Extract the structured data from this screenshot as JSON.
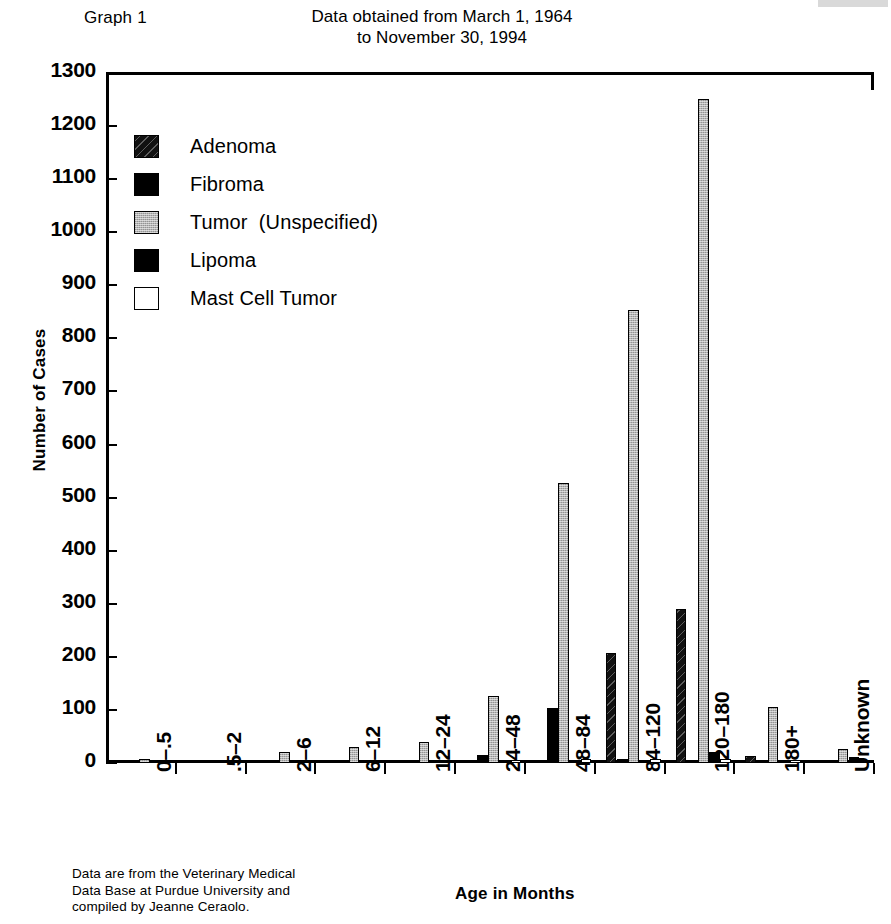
{
  "header": {
    "graph_number": "Graph 1",
    "subtitle_line1": "Data obtained from March 1, 1964",
    "subtitle_line2": "to November 30, 1994"
  },
  "axes": {
    "ylabel": "Number of Cases",
    "xlabel": "Age in Months"
  },
  "footnote": {
    "line1": "Data are from the Veterinary Medical",
    "line2": "Data Base at Purdue University and",
    "line3": "compiled by Jeanne Ceraolo."
  },
  "legend": {
    "items": [
      {
        "label": "Adenoma",
        "swatch": "hatched-diagonal",
        "color": "#1a1a1a"
      },
      {
        "label": "Fibroma",
        "swatch": "solid-black",
        "color": "#000000"
      },
      {
        "label": "Tumor  (Unspecified)",
        "swatch": "solid-gray",
        "color": "#b4b4b4"
      },
      {
        "label": "Lipoma",
        "swatch": "solid-black",
        "color": "#000000"
      },
      {
        "label": "Mast Cell Tumor",
        "swatch": "solid-white",
        "color": "#ffffff"
      }
    ]
  },
  "chart_data": {
    "type": "bar",
    "title": "Graph 1",
    "subtitle": "Data obtained from March 1, 1964 to November 30, 1994",
    "xlabel": "Age in Months",
    "ylabel": "Number of Cases",
    "ylim": [
      0,
      1300
    ],
    "ytick_step": 100,
    "yticks": [
      0,
      100,
      200,
      300,
      400,
      500,
      600,
      700,
      800,
      900,
      1000,
      1100,
      1200,
      1300
    ],
    "grid": false,
    "legend_position": "inside-top-left",
    "categories": [
      "0–.5",
      ".5–2",
      "2–6",
      "6–12",
      "12–24",
      "24–48",
      "48–84",
      "84–120",
      "120–180",
      "180+",
      "Unknown"
    ],
    "series": [
      {
        "name": "Adenoma",
        "color": "#1a1a1a",
        "fill": "hatched-diagonal",
        "values": [
          0,
          0,
          0,
          0,
          0,
          0,
          0,
          207,
          291,
          14,
          0
        ]
      },
      {
        "name": "Fibroma",
        "color": "#000000",
        "fill": "solid-black",
        "values": [
          0,
          0,
          0,
          0,
          2,
          15,
          104,
          8,
          5,
          0,
          0
        ]
      },
      {
        "name": "Tumor  (Unspecified)",
        "color": "#b4b4b4",
        "fill": "solid-gray",
        "values": [
          7,
          0,
          21,
          30,
          40,
          127,
          528,
          853,
          1251,
          106,
          27
        ]
      },
      {
        "name": "Lipoma",
        "color": "#000000",
        "fill": "solid-black",
        "values": [
          0,
          0,
          0,
          0,
          0,
          0,
          0,
          0,
          20,
          0,
          12
        ]
      },
      {
        "name": "Mast Cell Tumor",
        "color": "#ffffff",
        "fill": "solid-white",
        "values": [
          0,
          0,
          0,
          0,
          0,
          4,
          8,
          8,
          7,
          4,
          0
        ]
      }
    ]
  }
}
